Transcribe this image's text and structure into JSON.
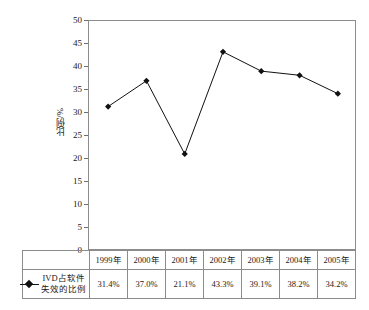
{
  "chart_data": {
    "type": "line",
    "title": "",
    "xlabel": "",
    "ylabel": "比例/%",
    "ylim": [
      0,
      50
    ],
    "ytick_step": 5,
    "yticks": [
      "50",
      "45",
      "40",
      "35",
      "30",
      "25",
      "20",
      "15",
      "10",
      "5",
      "0"
    ],
    "grid": false,
    "legend_position": "table-left",
    "categories": [
      "1999年",
      "2000年",
      "2001年",
      "2002年",
      "2003年",
      "2004年",
      "2005年"
    ],
    "series": [
      {
        "name": "IVD占软件失效的比例",
        "name_line1": "IVD占软件",
        "name_line2": "失效的比例",
        "values": [
          31.4,
          37.0,
          21.1,
          43.3,
          39.1,
          38.2,
          34.2
        ],
        "value_labels": [
          "31.4%",
          "37.0%",
          "21.1%",
          "43.3%",
          "39.1%",
          "38.2%",
          "34.2%"
        ],
        "marker": "diamond",
        "line_color": "#111111",
        "marker_color": "#111111"
      }
    ]
  },
  "table": {
    "header_row": [
      "1999年",
      "2000年",
      "2001年",
      "2002年",
      "2003年",
      "2004年",
      "2005年"
    ],
    "value_row": [
      "31.4%",
      "37.0%",
      "21.1%",
      "43.3%",
      "39.1%",
      "38.2%",
      "34.2%"
    ],
    "row_label_line1": "IVD占软件",
    "row_label_line2": "失效的比例"
  },
  "axis": {
    "y_title": "比例/%",
    "y_labels": [
      "50",
      "45",
      "40",
      "35",
      "30",
      "25",
      "20",
      "15",
      "10",
      "5",
      "0"
    ]
  },
  "colors": {
    "line": "#111111",
    "marker": "#111111",
    "border": "#8c8c8c",
    "background": "#ffffff"
  }
}
